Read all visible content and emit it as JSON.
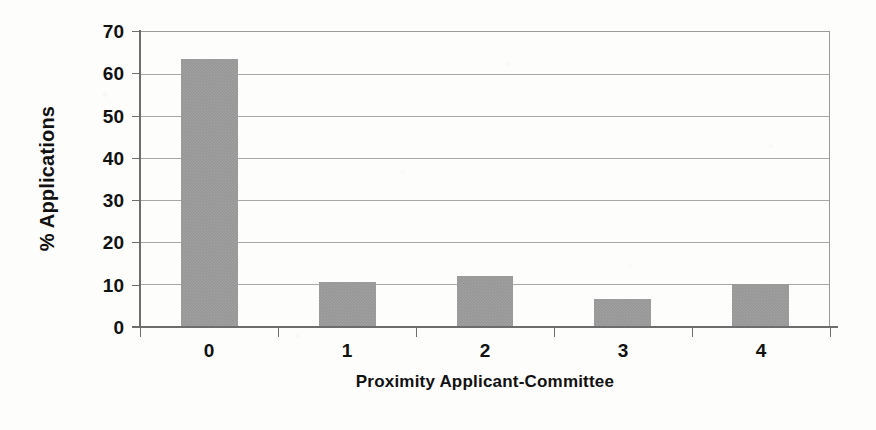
{
  "chart_data": {
    "type": "bar",
    "title": "",
    "subtitle": "",
    "xlabel": "Proximity Applicant-Committee",
    "ylabel": "% Applications",
    "categories": [
      "0",
      "1",
      "2",
      "3",
      "4"
    ],
    "values": [
      63.5,
      10.4,
      12.0,
      6.5,
      9.9
    ],
    "ylim": [
      0,
      70
    ],
    "ytick_labels": [
      "0",
      "10",
      "20",
      "30",
      "40",
      "50",
      "60",
      "70"
    ],
    "ytick_values": [
      0,
      10,
      20,
      30,
      40,
      50,
      60,
      70
    ],
    "grid": "horizontal",
    "legend": "none",
    "bar_color": "#969696",
    "axis_color": "#6d6d6d",
    "grid_color": "#a8a8a8",
    "background_color": "#fdfdfc",
    "text_color": "#111111"
  }
}
